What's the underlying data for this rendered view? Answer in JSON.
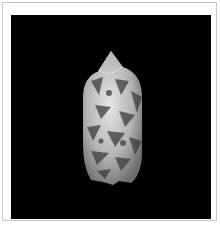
{
  "image": {
    "subject": "olive sea shell specimen",
    "background_color": "#000000",
    "frame_color": "#c8c8c8",
    "shell_colors": {
      "light": "#d8d8d8",
      "mid": "#a0a0a0",
      "dark": "#3c3c3c"
    }
  }
}
